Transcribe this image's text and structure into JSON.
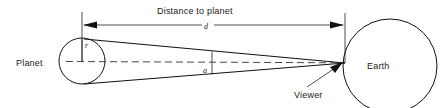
{
  "diagram": {
    "type": "angular-size-geometry",
    "title_label": "Distance to planet",
    "labels": {
      "planet": "Planet",
      "earth": "Earth",
      "viewer": "Viewer",
      "distance_symbol": "d",
      "radius_symbol": "r",
      "angle_symbol": "a"
    },
    "colors": {
      "background": "#ffffff",
      "stroke": "#111111",
      "text": "#1a1a1a",
      "dashed": "#333333"
    },
    "geometry": {
      "planet_circle": {
        "cx": 82,
        "cy": 61,
        "r": 23
      },
      "earth_circle": {
        "cx": 390,
        "cy": 66,
        "r": 47
      },
      "apex": {
        "x": 345,
        "y": 63
      },
      "cone_top": {
        "x": 84,
        "y": 39
      },
      "cone_bottom": {
        "x": 84,
        "y": 84
      },
      "dimension_line_y": 25,
      "dimension_left_x": 82,
      "dimension_right_x": 345,
      "angle_marker_x": 212
    }
  }
}
